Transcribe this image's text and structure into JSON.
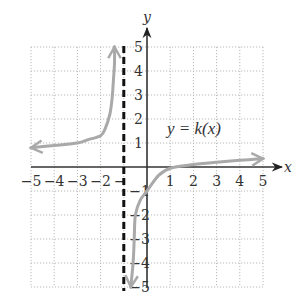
{
  "chart_data": {
    "type": "line",
    "title": "",
    "function_label": "y = k(x)",
    "xlabel": "x",
    "ylabel": "y",
    "xlim": [
      -5,
      5
    ],
    "ylim": [
      -5,
      5
    ],
    "x_ticks": [
      -5,
      -4,
      -3,
      -2,
      -1,
      1,
      2,
      3,
      4,
      5
    ],
    "x_tick_labels": [
      "−5",
      "−4",
      "−3",
      "−2",
      "−",
      "1",
      "2",
      "3",
      "4",
      "5"
    ],
    "y_ticks": [
      5,
      4,
      3,
      2,
      1,
      -1,
      -2,
      -3,
      -4,
      -5
    ],
    "y_tick_labels": [
      "5",
      "4",
      "3",
      "2",
      "1",
      "−1",
      "−2",
      "−3",
      "−4",
      "−5"
    ],
    "grid": true,
    "grid_style": "dotted",
    "vertical_asymptote": {
      "x": -1,
      "style": "dashed"
    },
    "series": [
      {
        "name": "left branch (x < -1)",
        "color": "#a9a9a9",
        "arrows": [
          "start"
        ],
        "points": [
          [
            -5,
            0.8
          ],
          [
            -4,
            0.9
          ],
          [
            -3,
            1.0
          ],
          [
            -2.5,
            1.15
          ],
          [
            -2,
            1.3
          ],
          [
            -1.8,
            1.6
          ],
          [
            -1.6,
            2.2
          ],
          [
            -1.5,
            2.9
          ],
          [
            -1.45,
            3.6
          ],
          [
            -1.4,
            4.3
          ],
          [
            -1.4,
            5
          ]
        ]
      },
      {
        "name": "right branch (x > -1)",
        "color": "#a9a9a9",
        "arrows": [
          "start",
          "end"
        ],
        "points": [
          [
            -0.7,
            -5
          ],
          [
            -0.6,
            -4
          ],
          [
            -0.55,
            -3
          ],
          [
            -0.5,
            -2
          ],
          [
            -0.3,
            -1.4
          ],
          [
            0,
            -1
          ],
          [
            0.5,
            -0.35
          ],
          [
            1,
            -0.05
          ],
          [
            2,
            0.1
          ],
          [
            3,
            0.2
          ],
          [
            4,
            0.28
          ],
          [
            5,
            0.35
          ]
        ]
      }
    ],
    "legend": null
  }
}
